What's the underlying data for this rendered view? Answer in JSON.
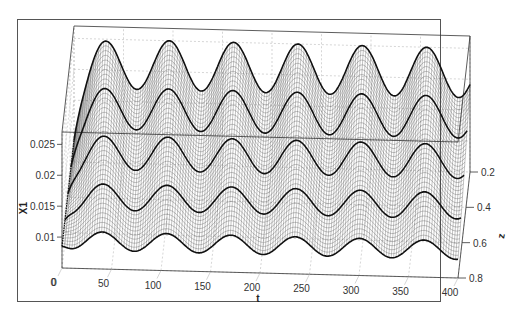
{
  "chart_data": {
    "type": "surface",
    "title": "",
    "xlabel": "t",
    "ylabel": "z",
    "zlabel": "X1",
    "x_ticks": [
      "0",
      "50",
      "100",
      "150",
      "200",
      "250",
      "300",
      "350",
      "400"
    ],
    "y_ticks": [
      "0.2",
      "0.4",
      "0.6",
      "0.8"
    ],
    "z_ticks": [
      "0.01",
      "0.015",
      "0.02",
      "0.025"
    ],
    "xlim": [
      0,
      400
    ],
    "ylim": [
      0.2,
      0.8
    ],
    "zlim": [
      0.005,
      0.027
    ],
    "grid": true,
    "surface": {
      "description": "Mesh surface oscillating sinusoidally along t with ~6 peaks; amplitude and mean increase toward z=0.2; initial rise from t=0",
      "period_t": 65,
      "peaks_count": 6,
      "highlighted_lines_z": [
        0.2,
        0.35,
        0.5,
        0.65,
        0.8
      ],
      "X1_at_z_0_2": {
        "mean": 0.021,
        "amplitude": 0.004
      },
      "X1_at_z_0_8": {
        "mean": 0.0095,
        "amplitude": 0.0015
      }
    }
  },
  "colors": {
    "mesh": "#333333",
    "highlight_line": "#111111",
    "grid": "#bbbbbb",
    "axes": "#333333",
    "background": "#ffffff"
  }
}
